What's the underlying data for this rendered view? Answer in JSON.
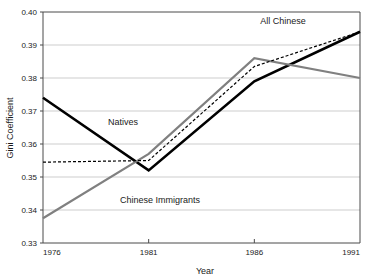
{
  "chart_data": {
    "type": "line",
    "title": "",
    "xlabel": "Year",
    "ylabel": "Gini Coefficient",
    "categories": [
      "1976",
      "1981",
      "1986",
      "1991"
    ],
    "x": [
      1976,
      1981,
      1986,
      1991
    ],
    "xlim": [
      1976,
      1991
    ],
    "ylim": [
      0.33,
      0.4
    ],
    "ytick_labels": [
      "0.33",
      "0.34",
      "0.35",
      "0.36",
      "0.37",
      "0.38",
      "0.39",
      "0.40"
    ],
    "ytick_values": [
      0.33,
      0.34,
      0.35,
      0.36,
      0.37,
      0.38,
      0.39,
      0.4
    ],
    "grid": "horizontal",
    "legend": "none-inline-annotations",
    "series": [
      {
        "name": "Natives",
        "values": [
          0.374,
          0.352,
          0.379,
          0.394
        ],
        "color": "#000000",
        "style": "solid",
        "width": 2.6
      },
      {
        "name": "Chinese Immigrants",
        "values": [
          0.3375,
          0.357,
          0.386,
          0.38
        ],
        "color": "#808080",
        "style": "solid",
        "width": 2.2
      },
      {
        "name": "All Chinese",
        "values": [
          0.3545,
          0.355,
          0.3835,
          0.394
        ],
        "color": "#000000",
        "style": "dotted",
        "width": 1.2
      }
    ],
    "annotations": [
      {
        "text": "All Chinese",
        "x": 283,
        "y": 24,
        "anchor": "middle"
      },
      {
        "text": "Natives",
        "x": 123,
        "y": 125,
        "anchor": "middle"
      },
      {
        "text": "Chinese Immigrants",
        "x": 160,
        "y": 203,
        "anchor": "middle"
      }
    ]
  },
  "axes": {
    "y_title": "Gini Coefficient",
    "x_title": "Year"
  }
}
